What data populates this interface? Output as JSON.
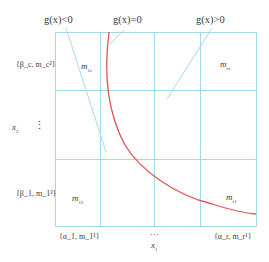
{
  "conditions": {
    "negative": "g(x)<0",
    "zero": "g(x)=0",
    "positive": "g(x)>0"
  },
  "cells": {
    "top_left": {
      "base": "m",
      "sub": "1c"
    },
    "top_right": {
      "base": "m",
      "sub": "rc"
    },
    "bottom_left": {
      "base": "m",
      "sub": "11"
    },
    "bottom_right": {
      "base": "m",
      "sub": "r1"
    }
  },
  "y_axis": {
    "label": "x",
    "label_sub": "2",
    "ellipsis": "⋮",
    "ticks": [
      "{β_c, m_c²}",
      "{β_1, m_1²}"
    ]
  },
  "x_axis": {
    "label": "x",
    "label_sub": "1",
    "ellipsis": "···",
    "ticks": [
      "{α_1, m_1¹}",
      "{α_r, m_r¹}"
    ]
  },
  "colors": {
    "grid": "#9fd4ea",
    "curve": "#e05050",
    "leader": "#9fd4ea",
    "text": "#3a3a3a"
  }
}
